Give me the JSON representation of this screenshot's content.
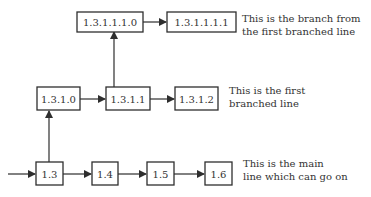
{
  "diagram": {
    "nodes": {
      "n_1_3": "1.3",
      "n_1_4": "1.4",
      "n_1_5": "1.5",
      "n_1_6": "1.6",
      "n_1_3_1_0": "1.3.1.0",
      "n_1_3_1_1": "1.3.1.1",
      "n_1_3_1_2": "1.3.1.2",
      "n_1_3_1_1_1_0": "1.3.1.1.1.0",
      "n_1_3_1_1_1_1": "1.3.1.1.1.1"
    },
    "edges": [
      [
        "input",
        "1.3"
      ],
      [
        "1.3",
        "1.4"
      ],
      [
        "1.4",
        "1.5"
      ],
      [
        "1.5",
        "1.6"
      ],
      [
        "1.3",
        "1.3.1.0"
      ],
      [
        "1.3.1.0",
        "1.3.1.1"
      ],
      [
        "1.3.1.1",
        "1.3.1.2"
      ],
      [
        "1.3.1.1",
        "1.3.1.1.1.0"
      ],
      [
        "1.3.1.1.1.0",
        "1.3.1.1.1.1"
      ]
    ],
    "annotations": {
      "branch_from_branch": {
        "line1": "This is the branch from",
        "line2": "the first branched line"
      },
      "first_branch": {
        "line1": "This is the first",
        "line2": "branched line"
      },
      "main_line": {
        "line1": "This is the main",
        "line2": "line which can go on"
      }
    },
    "colors": {
      "stroke": "#2e2e2e",
      "text": "#333333",
      "background": "#ffffff"
    }
  }
}
